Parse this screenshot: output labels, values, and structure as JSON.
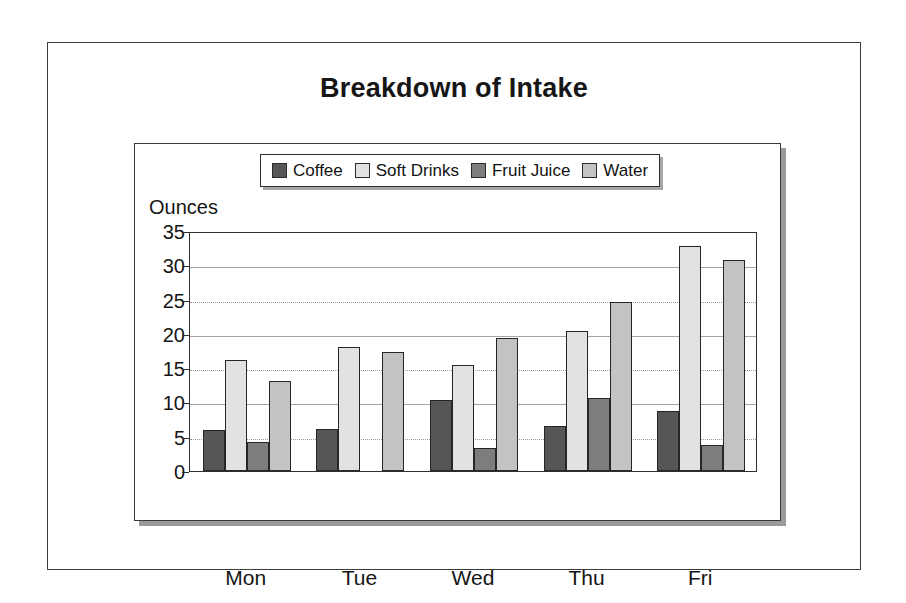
{
  "title": "Breakdown of Intake",
  "chart_data": {
    "type": "bar",
    "title": "Breakdown of Intake",
    "xlabel": "",
    "ylabel": "Ounces",
    "ylim": [
      0,
      35
    ],
    "yticks": [
      "0",
      "5",
      "10",
      "15",
      "20",
      "25",
      "30",
      "35"
    ],
    "grid": true,
    "legend_position": "top-center",
    "categories": [
      "Mon",
      "Tue",
      "Wed",
      "Thu",
      "Fri"
    ],
    "series": [
      {
        "name": "Coffee",
        "color": "#565656",
        "values": [
          6.0,
          6.2,
          10.3,
          6.5,
          8.8
        ]
      },
      {
        "name": "Soft Drinks",
        "color": "#e2e2e2",
        "values": [
          16.2,
          18.1,
          15.4,
          20.4,
          32.8
        ]
      },
      {
        "name": "Fruit Juice",
        "color": "#7d7d7d",
        "values": [
          4.2,
          0,
          3.4,
          10.6,
          3.8
        ]
      },
      {
        "name": "Water",
        "color": "#c3c3c3",
        "values": [
          13.2,
          17.3,
          19.4,
          24.6,
          30.8
        ]
      }
    ]
  }
}
